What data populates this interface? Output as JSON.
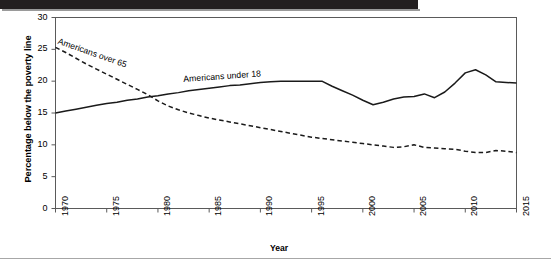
{
  "chart_data": {
    "type": "line",
    "title": "",
    "xlabel": "Year",
    "ylabel": "Percentage below the poverty line",
    "xlim": [
      1970,
      2015
    ],
    "ylim": [
      0,
      30
    ],
    "grid": false,
    "legend_position": "inline-labels",
    "yticks": [
      0,
      5,
      10,
      15,
      20,
      25,
      30
    ],
    "ytick_labels": [
      "0",
      "5",
      "10",
      "15",
      "20",
      "25",
      "30"
    ],
    "xticks": [
      1970,
      1975,
      1980,
      1985,
      1990,
      1995,
      2000,
      2005,
      2010,
      2015
    ],
    "xtick_labels": [
      "1970",
      "1975",
      "1980",
      "1985",
      "1990",
      "1995",
      "2000",
      "2005",
      "2010",
      "2015"
    ],
    "series": [
      {
        "name": "Americans over 65",
        "style": "dashed",
        "color": "#1a1a1a",
        "x": [
          1970,
          1971,
          1972,
          1973,
          1974,
          1975,
          1976,
          1977,
          1978,
          1979,
          1980,
          1981,
          1982,
          1983,
          1984,
          1985,
          1986,
          1987,
          1988,
          1989,
          1990,
          1991,
          1992,
          1993,
          1994,
          1995,
          1996,
          1997,
          1998,
          1999,
          2000,
          2001,
          2002,
          2003,
          2004,
          2005,
          2006,
          2007,
          2008,
          2009,
          2010,
          2011,
          2012,
          2013,
          2014,
          2015
        ],
        "y": [
          25.3,
          24.5,
          23.6,
          22.7,
          21.9,
          21.1,
          20.3,
          19.5,
          18.7,
          17.9,
          16.9,
          16.1,
          15.5,
          15.0,
          14.6,
          14.2,
          13.9,
          13.6,
          13.3,
          13.0,
          12.7,
          12.4,
          12.1,
          11.8,
          11.5,
          11.2,
          11.0,
          10.8,
          10.6,
          10.4,
          10.2,
          10.0,
          9.8,
          9.6,
          9.7,
          10.0,
          9.6,
          9.5,
          9.4,
          9.3,
          9.0,
          8.8,
          8.8,
          9.1,
          9.0,
          8.8
        ]
      },
      {
        "name": "Americans under 18",
        "style": "solid",
        "color": "#1a1a1a",
        "x": [
          1970,
          1971,
          1972,
          1973,
          1974,
          1975,
          1976,
          1977,
          1978,
          1979,
          1980,
          1981,
          1982,
          1983,
          1984,
          1985,
          1986,
          1987,
          1988,
          1989,
          1990,
          1991,
          1992,
          1993,
          1994,
          1995,
          1996,
          1997,
          1998,
          1999,
          2000,
          2001,
          2002,
          2003,
          2004,
          2005,
          2006,
          2007,
          2008,
          2009,
          2010,
          2011,
          2012,
          2013,
          2014,
          2015
        ],
        "y": [
          15.0,
          15.3,
          15.6,
          15.9,
          16.2,
          16.5,
          16.7,
          17.0,
          17.2,
          17.5,
          17.7,
          18.0,
          18.2,
          18.5,
          18.7,
          18.9,
          19.1,
          19.3,
          19.4,
          19.6,
          19.8,
          19.9,
          20.0,
          20.0,
          20.0,
          20.0,
          20.0,
          19.2,
          18.5,
          17.8,
          17.0,
          16.3,
          16.7,
          17.2,
          17.5,
          17.6,
          18.0,
          17.4,
          18.3,
          19.7,
          21.3,
          21.8,
          21.0,
          19.9,
          19.8,
          19.7
        ]
      }
    ],
    "annotations": [
      {
        "text": "Americans over 65",
        "series": "Americans over 65"
      },
      {
        "text": "Americans under 18",
        "series": "Americans under 18"
      }
    ]
  },
  "figure": {
    "axis_color": "#5a5a5a",
    "frame_visible": true
  }
}
